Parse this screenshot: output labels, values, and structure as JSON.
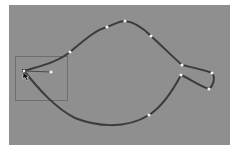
{
  "app": {
    "view": "vector-path-editor"
  },
  "canvas": {
    "background": "#8f8f8f",
    "x": 9,
    "y": 5,
    "width": 221,
    "height": 140
  },
  "selection_box": {
    "x": 15,
    "y": 56,
    "width": 52,
    "height": 44,
    "stroke": "#6e6e6e"
  },
  "path": {
    "stroke": "#3b3b3b",
    "stroke_width": 2,
    "shape": "leaf-outline"
  },
  "anchor_points": [
    {
      "name": "tip",
      "x": 24,
      "y": 71
    },
    {
      "name": "upper-left",
      "x": 70,
      "y": 52
    },
    {
      "name": "top-left",
      "x": 107,
      "y": 27
    },
    {
      "name": "top",
      "x": 125,
      "y": 21
    },
    {
      "name": "upper-right",
      "x": 151,
      "y": 36
    },
    {
      "name": "stem-top-base",
      "x": 182,
      "y": 65
    },
    {
      "name": "stem-bottom-base",
      "x": 181,
      "y": 75
    },
    {
      "name": "stem-end-top",
      "x": 212,
      "y": 73
    },
    {
      "name": "stem-end-bottom",
      "x": 209,
      "y": 89
    },
    {
      "name": "bottom",
      "x": 149,
      "y": 115
    }
  ],
  "handle": {
    "from": {
      "x": 24,
      "y": 71
    },
    "to": {
      "x": 51,
      "y": 72
    }
  },
  "cursor": {
    "type": "direct-selection-arrow",
    "x": 24,
    "y": 74
  },
  "point_color": "#f2f2f2"
}
